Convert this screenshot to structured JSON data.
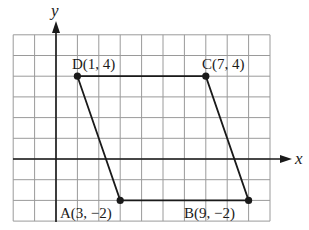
{
  "diagram": {
    "type": "coordinate-plane-parallelogram",
    "axes": {
      "x_label": "x",
      "y_label": "y"
    },
    "grid": {
      "x_min": -2,
      "x_max": 10,
      "y_min": -3,
      "y_max": 6
    },
    "points": [
      {
        "name": "D",
        "x": 1,
        "y": 4,
        "label": "D(1, 4)"
      },
      {
        "name": "C",
        "x": 7,
        "y": 4,
        "label": "C(7, 4)"
      },
      {
        "name": "A",
        "x": 3,
        "y": -2,
        "label": "A(3, −2)"
      },
      {
        "name": "B",
        "x": 9,
        "y": -2,
        "label": "B(9, −2)"
      }
    ],
    "polygon": [
      "D",
      "C",
      "B",
      "A"
    ],
    "colors": {
      "grid": "#9a9a9a",
      "axis": "#1a1a1a",
      "shape": "#1a1a1a"
    }
  }
}
